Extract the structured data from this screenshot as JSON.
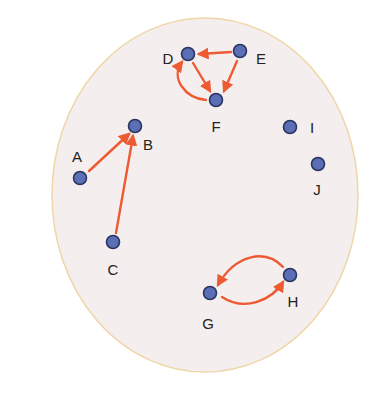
{
  "diagram": {
    "type": "directed-graph",
    "colors": {
      "background": "#ffffff",
      "region_fill": "#f4efee",
      "region_stroke": "#efd6a6",
      "node_fill": "#5a6fb6",
      "node_stroke": "#2b3560",
      "edge": "#ee5a32",
      "label": "#222222"
    },
    "nodes": [
      {
        "id": "A",
        "label": "A"
      },
      {
        "id": "B",
        "label": "B"
      },
      {
        "id": "C",
        "label": "C"
      },
      {
        "id": "D",
        "label": "D"
      },
      {
        "id": "E",
        "label": "E"
      },
      {
        "id": "F",
        "label": "F"
      },
      {
        "id": "G",
        "label": "G"
      },
      {
        "id": "H",
        "label": "H"
      },
      {
        "id": "I",
        "label": "I"
      },
      {
        "id": "J",
        "label": "J"
      }
    ],
    "edges": [
      {
        "from": "A",
        "to": "B"
      },
      {
        "from": "C",
        "to": "B"
      },
      {
        "from": "E",
        "to": "D"
      },
      {
        "from": "E",
        "to": "F"
      },
      {
        "from": "D",
        "to": "F"
      },
      {
        "from": "F",
        "to": "D"
      },
      {
        "from": "G",
        "to": "H"
      },
      {
        "from": "H",
        "to": "G"
      }
    ]
  }
}
